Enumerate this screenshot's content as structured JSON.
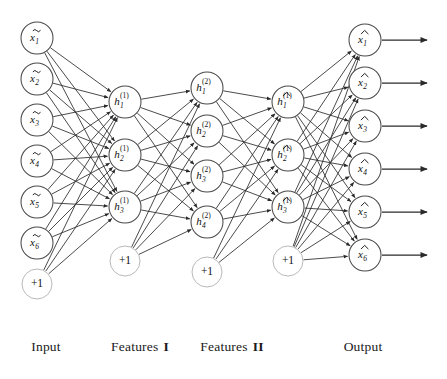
{
  "diagram": {
    "background_color": "#ffffff",
    "node_stroke_color": "#4a4a4a",
    "bias_stroke_color": "#b9b9b9",
    "edge_color": "#2a2a2a",
    "node_radius": 16,
    "bias_radius": 15
  },
  "layers": [
    {
      "id": "input",
      "caption": "Input",
      "caption_x": 46,
      "x": 37,
      "nodes": [
        {
          "base": "x",
          "accent": "tilde",
          "sub": "1",
          "sup": "",
          "cy": 38
        },
        {
          "base": "x",
          "accent": "tilde",
          "sub": "2",
          "sup": "",
          "cy": 79
        },
        {
          "base": "x",
          "accent": "tilde",
          "sub": "3",
          "sup": "",
          "cy": 120
        },
        {
          "base": "x",
          "accent": "tilde",
          "sub": "4",
          "sup": "",
          "cy": 161
        },
        {
          "base": "x",
          "accent": "tilde",
          "sub": "5",
          "sup": "",
          "cy": 202
        },
        {
          "base": "x",
          "accent": "tilde",
          "sub": "6",
          "sup": "",
          "cy": 243
        }
      ],
      "bias": {
        "label": "+1",
        "cy": 284
      }
    },
    {
      "id": "features-1",
      "caption": "Features",
      "caption_numeral": "I",
      "caption_x": 140,
      "x": 125,
      "nodes": [
        {
          "base": "h",
          "accent": "none",
          "sub": "1",
          "sup": "(1)",
          "cy": 102
        },
        {
          "base": "h",
          "accent": "none",
          "sub": "2",
          "sup": "(1)",
          "cy": 155
        },
        {
          "base": "h",
          "accent": "none",
          "sub": "3",
          "sup": "(1)",
          "cy": 207
        }
      ],
      "bias": {
        "label": "+1",
        "cy": 261
      }
    },
    {
      "id": "features-2",
      "caption": "Features",
      "caption_numeral": "II",
      "caption_x": 232,
      "x": 207,
      "nodes": [
        {
          "base": "h",
          "accent": "none",
          "sub": "1",
          "sup": "(2)",
          "cy": 88
        },
        {
          "base": "h",
          "accent": "none",
          "sub": "2",
          "sup": "(2)",
          "cy": 131
        },
        {
          "base": "h",
          "accent": "none",
          "sub": "3",
          "sup": "(2)",
          "cy": 176
        },
        {
          "base": "h",
          "accent": "none",
          "sub": "4",
          "sup": "(2)",
          "cy": 222
        }
      ],
      "bias": {
        "label": "+1",
        "cy": 272
      }
    },
    {
      "id": "features-1-decoded",
      "caption": "",
      "caption_x": 288,
      "x": 288,
      "nodes": [
        {
          "base": "h",
          "accent": "hat",
          "sub": "1",
          "sup": "(1)",
          "cy": 102
        },
        {
          "base": "h",
          "accent": "hat",
          "sub": "2",
          "sup": "(1)",
          "cy": 155
        },
        {
          "base": "h",
          "accent": "hat",
          "sub": "3",
          "sup": "(1)",
          "cy": 207
        }
      ],
      "bias": {
        "label": "+1",
        "cy": 261
      }
    },
    {
      "id": "output",
      "caption": "Output",
      "caption_x": 363,
      "x": 365,
      "nodes": [
        {
          "base": "x",
          "accent": "hat",
          "sub": "1",
          "sup": "",
          "cy": 40
        },
        {
          "base": "x",
          "accent": "hat",
          "sub": "2",
          "sup": "",
          "cy": 83
        },
        {
          "base": "x",
          "accent": "hat",
          "sub": "3",
          "sup": "",
          "cy": 126
        },
        {
          "base": "x",
          "accent": "hat",
          "sub": "4",
          "sup": "",
          "cy": 169
        },
        {
          "base": "x",
          "accent": "hat",
          "sub": "5",
          "sup": "",
          "cy": 212
        },
        {
          "base": "x",
          "accent": "hat",
          "sub": "6",
          "sup": "",
          "cy": 255
        }
      ],
      "bias": null
    }
  ],
  "connections": [
    {
      "from": "input",
      "to": "features-1",
      "include_bias_source": true,
      "fully_connected": true
    },
    {
      "from": "features-1",
      "to": "features-2",
      "include_bias_source": true,
      "fully_connected": true
    },
    {
      "from": "features-2",
      "to": "features-1-decoded",
      "include_bias_source": true,
      "fully_connected": true
    },
    {
      "from": "features-1-decoded",
      "to": "output",
      "include_bias_source": true,
      "fully_connected": true
    }
  ],
  "output_arrows": {
    "count": 6,
    "start_offset": 17,
    "end_x": 427
  },
  "captions_y": 348
}
